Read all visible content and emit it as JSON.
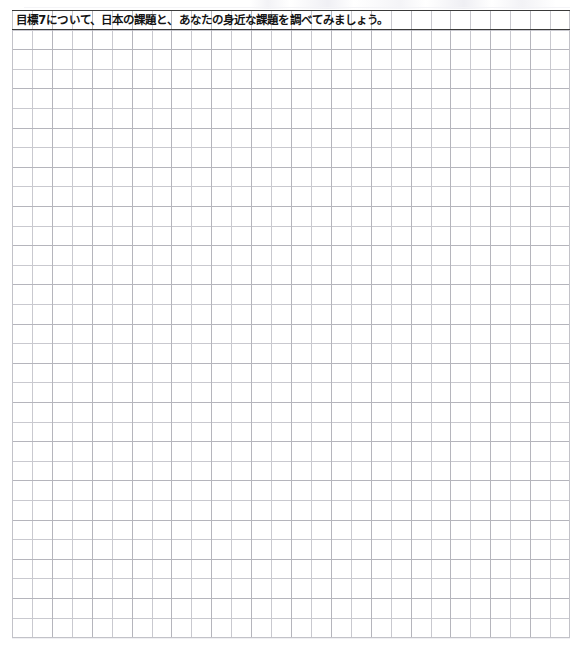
{
  "worksheet": {
    "prompt": "目標7について、日本の課題と、あなたの身近な課題を調べてみましょう。",
    "grid": {
      "cell_size_px": 20,
      "columns": 28,
      "rows": 32,
      "minor_line_color": "#c9c9cf",
      "major_line_color": "#b4b4bb",
      "frame_color": "#c2c2c8",
      "prompt_rule_color": "#3a3a3a",
      "background_color": "#ffffff"
    }
  }
}
